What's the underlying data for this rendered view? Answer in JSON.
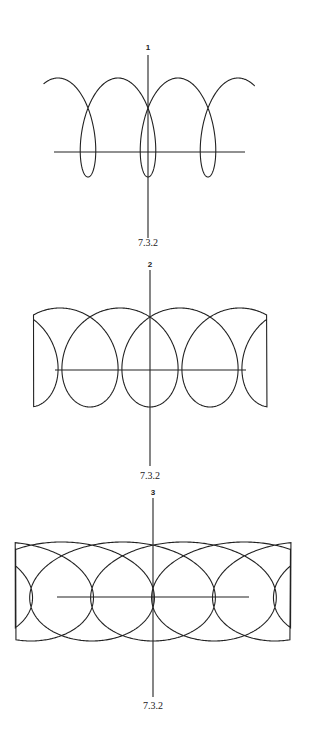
{
  "figures": [
    {
      "label": "1",
      "caption": "7.3.2",
      "label_pos": [
        148,
        50
      ],
      "caption_pos": [
        148,
        246
      ],
      "v_axis": {
        "x": 148,
        "y1": 55,
        "y2": 238
      },
      "h_axis": {
        "y": 152,
        "x1": 54,
        "x2": 245
      },
      "curve": {
        "x0": 148,
        "yc": 127.5,
        "a": 9.55,
        "c": 20.5,
        "b": 49.5,
        "x_min": 43,
        "x_max": 255
      }
    },
    {
      "label": "2",
      "caption": "7.3.2",
      "label_pos": [
        150,
        267
      ],
      "caption_pos": [
        150,
        479
      ],
      "v_axis": {
        "x": 150,
        "y1": 270,
        "y2": 466
      },
      "h_axis": {
        "y": 370,
        "x1": 55,
        "x2": 246
      },
      "curve": {
        "x0": 150,
        "yc": 357.5,
        "a": 9.55,
        "c": 42,
        "b": 49.5,
        "x_min": 33,
        "x_max": 267
      }
    },
    {
      "label": "3",
      "caption": "7.3.2",
      "label_pos": [
        153,
        495
      ],
      "caption_pos": [
        153,
        709
      ],
      "v_axis": {
        "x": 153,
        "y1": 498,
        "y2": 697
      },
      "h_axis": {
        "y": 597,
        "x1": 57,
        "x2": 249
      },
      "curve": {
        "x0": 153,
        "yc": 591.5,
        "a": 9.7,
        "c": 77,
        "b": 49.5,
        "x_min": 15,
        "x_max": 291
      }
    }
  ],
  "style": {
    "stroke": "#222222"
  }
}
